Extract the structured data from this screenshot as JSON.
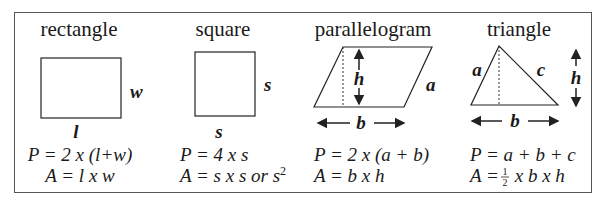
{
  "shapes": {
    "rectangle": {
      "title": "rectangle",
      "side_labels": {
        "width": "w",
        "length": "l"
      },
      "perimeter": "P = 2 x (l+w)",
      "area": "A = l x w"
    },
    "square": {
      "title": "square",
      "side_labels": {
        "right": "s",
        "bottom": "s"
      },
      "perimeter": "P = 4 x s",
      "area_main": "A = s x s or s",
      "area_exp": "2"
    },
    "parallelogram": {
      "title": "parallelogram",
      "side_labels": {
        "height": "h",
        "side": "a",
        "base": "b"
      },
      "perimeter": "P = 2 x (a + b)",
      "area": "A = b x h"
    },
    "triangle": {
      "title": "triangle",
      "side_labels": {
        "left": "a",
        "right": "c",
        "height": "h",
        "base": "b"
      },
      "perimeter": "P = a + b + c",
      "area_prefix": "A = ",
      "area_frac_num": "1",
      "area_frac_den": "2",
      "area_suffix": " x b x h"
    }
  }
}
